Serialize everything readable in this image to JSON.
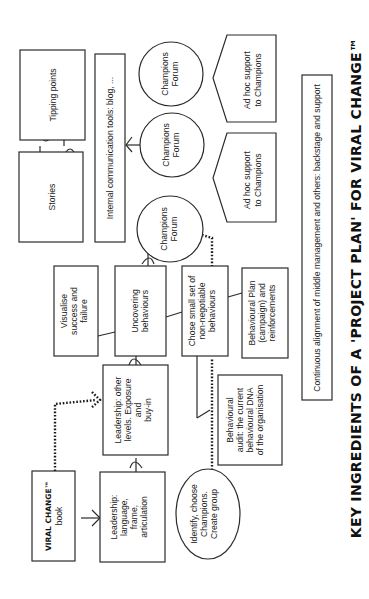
{
  "title": "KEY INGREDIENTS OF A 'PROJECT PLAN' FOR VIRAL CHANGE™",
  "nodes": {
    "tipping_points": [
      "Tipping points"
    ],
    "stories": [
      "Stories"
    ],
    "internal_comm": [
      "Internal communication tools: blog, ..."
    ],
    "forum_1": [
      "Champions",
      "Forum"
    ],
    "forum_2": [
      "Champions",
      "Forum"
    ],
    "forum_3": [
      "Champions",
      "Forum"
    ],
    "adhoc_1": [
      "Ad hoc support",
      "to Champions"
    ],
    "adhoc_2": [
      "Ad hoc support",
      "to Champions"
    ],
    "continuous": [
      "Continuous alignment of middle management and others: backstage and support"
    ],
    "visualise": [
      "Visualise",
      "success and",
      "failure"
    ],
    "uncovering": [
      "Uncovering",
      "behaviours"
    ],
    "chose": [
      "Chose small set of",
      "non-negotiable",
      "behaviours"
    ],
    "behavioural_plan": [
      "Behavioural Plan",
      "(campaign) and",
      "reinforcements"
    ],
    "leadership_other": [
      "Leadership: other",
      "levels. Exposure",
      "and",
      "buy-in"
    ],
    "behavioural_audit": [
      "Behavioural",
      "audit: the current",
      "behavioural DNA",
      "of the organisation"
    ],
    "book": [
      "VIRAL CHANGE™",
      "book"
    ],
    "leadership_language": [
      "Leadership:",
      "language,",
      "frame,",
      "articulation"
    ],
    "identify": [
      "Identify, choose",
      "Champions.",
      "Create group"
    ]
  },
  "colors": {
    "stroke": "#2b2b2b",
    "background": "#ffffff",
    "text": "#222222"
  }
}
